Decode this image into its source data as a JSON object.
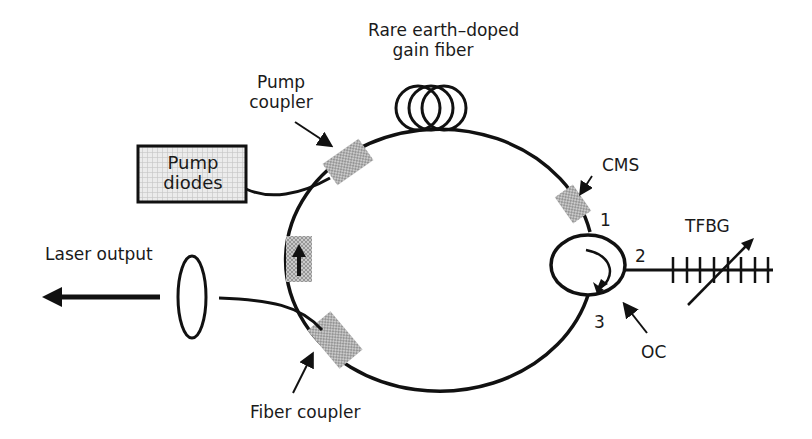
{
  "diagram": {
    "type": "fiber-ring-laser-schematic",
    "colors": {
      "line": "#111111",
      "component_fill": "#b8b8b8",
      "box_fill": "#e6e6e6",
      "background": "#ffffff"
    },
    "labels": {
      "gain_fiber_line1": "Rare earth–doped",
      "gain_fiber_line2": "gain fiber",
      "pump_coupler_line1": "Pump",
      "pump_coupler_line2": "coupler",
      "pump_diodes_line1": "Pump",
      "pump_diodes_line2": "diodes",
      "cms": "CMS",
      "tfbg": "TFBG",
      "laser_output": "Laser output",
      "oc": "OC",
      "fiber_coupler": "Fiber coupler",
      "port1": "1",
      "port2": "2",
      "port3": "3"
    },
    "components": [
      {
        "id": "pump-diodes",
        "label": "Pump diodes"
      },
      {
        "id": "pump-coupler",
        "label": "Pump coupler"
      },
      {
        "id": "gain-fiber",
        "label": "Rare earth–doped gain fiber"
      },
      {
        "id": "cms",
        "label": "CMS"
      },
      {
        "id": "optical-circulator",
        "label": "OC",
        "ports": [
          "1",
          "2",
          "3"
        ]
      },
      {
        "id": "tfbg",
        "label": "TFBG"
      },
      {
        "id": "fiber-coupler",
        "label": "Fiber coupler"
      },
      {
        "id": "isolator",
        "label": ""
      },
      {
        "id": "lens",
        "label": ""
      },
      {
        "id": "output-arrow",
        "label": "Laser output"
      }
    ]
  }
}
